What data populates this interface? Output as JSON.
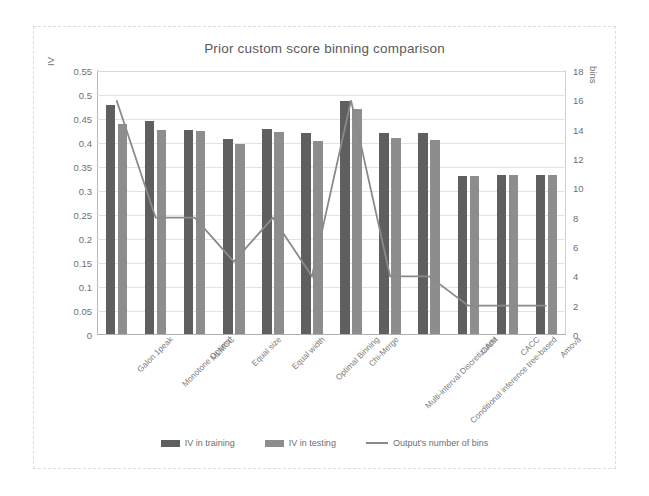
{
  "chart_data": {
    "type": "bar",
    "title": "Prior custom score binning comparison",
    "xlabel": "",
    "ylabel": "IV",
    "y2label": "bins",
    "ylim": [
      0,
      0.55
    ],
    "y2lim": [
      0,
      18
    ],
    "yticks": [
      "0",
      "0.05",
      "0.1",
      "0.15",
      "0.2",
      "0.25",
      "0.3",
      "0.35",
      "0.4",
      "0.45",
      "0.5",
      "0.55"
    ],
    "y2ticks": [
      "0",
      "2",
      "4",
      "6",
      "8",
      "10",
      "12",
      "14",
      "16",
      "18"
    ],
    "grid": true,
    "legend_position": "bottom",
    "categories": [
      "Galon 1peak",
      "Monotone Optimal",
      "MLMCC",
      "Equal size",
      "Equal width",
      "Optimal Binning",
      "Chi-Merge",
      "Multi-interval Discretization",
      "Conditional inference tree-based",
      "CAIM",
      "CACC",
      "Amova"
    ],
    "series": [
      {
        "name": "IV in training",
        "axis": "left",
        "type": "bar",
        "color": "#5f5f5f",
        "values": [
          0.478,
          0.443,
          0.424,
          0.407,
          0.428,
          0.418,
          0.485,
          0.419,
          0.418,
          0.33,
          0.331,
          0.331
        ]
      },
      {
        "name": "IV in testing",
        "axis": "left",
        "type": "bar",
        "color": "#8d8d8d",
        "values": [
          0.437,
          0.424,
          0.423,
          0.395,
          0.421,
          0.403,
          0.468,
          0.409,
          0.405,
          0.33,
          0.331,
          0.331
        ]
      },
      {
        "name": "Output's number of bins",
        "axis": "right",
        "type": "line",
        "color": "#8a8a8a",
        "values": [
          16,
          8,
          8,
          5,
          8,
          4,
          16,
          4,
          4,
          2,
          2,
          2
        ]
      }
    ]
  },
  "legend": {
    "train_label": "IV in training",
    "test_label": "IV in testing",
    "line_label": "Output's number of bins"
  }
}
